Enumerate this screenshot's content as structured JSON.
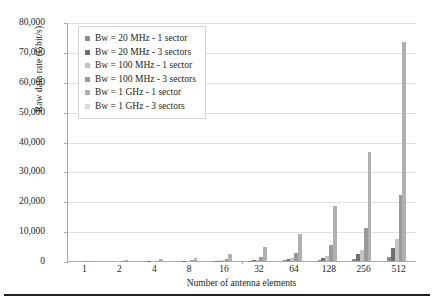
{
  "chart_data": {
    "type": "bar",
    "title": "",
    "xlabel": "Number of antenna elements",
    "ylabel": "Raw data rate (Gbit/s)",
    "categories": [
      "1",
      "2",
      "4",
      "8",
      "16",
      "32",
      "64",
      "128",
      "256",
      "512"
    ],
    "ylim": [
      0,
      80000
    ],
    "yticks": [
      0,
      10000,
      20000,
      30000,
      40000,
      50000,
      60000,
      70000,
      80000
    ],
    "ytick_labels": [
      "0",
      "10,000",
      "20,000",
      "30,000",
      "40,000",
      "50,000",
      "60,000",
      "70,000",
      "80,000"
    ],
    "grid": "horizontal",
    "legend_position": "upper-left-inside",
    "series": [
      {
        "name": "Bw = 20 MHz - 1 sector",
        "color": "#8c8c8c",
        "values": [
          2.8,
          5.7,
          11.4,
          22.9,
          45.8,
          91.5,
          183,
          366,
          732,
          1464
        ]
      },
      {
        "name": "Bw = 20 MHz - 3 sectors",
        "color": "#6e6e6e",
        "values": [
          8.6,
          17.2,
          34.3,
          68.6,
          137,
          275,
          549,
          1098,
          2196,
          4392
        ]
      },
      {
        "name": "Bw = 100 MHz - 1 sector",
        "color": "#c4c4c4",
        "values": [
          14.3,
          28.6,
          57.2,
          114,
          229,
          458,
          915,
          1830,
          3660,
          7320
        ]
      },
      {
        "name": "Bw = 100 MHz - 3 sectors",
        "color": "#9a9a9a",
        "values": [
          42.9,
          85.8,
          172,
          343,
          686,
          1373,
          2745,
          5490,
          10980,
          21960
        ]
      },
      {
        "name": "Bw = 1 GHz - 1 sector",
        "color": "#b0b0b0",
        "values": [
          143,
          286,
          572,
          1144,
          2288,
          4576,
          9152,
          18304,
          36608,
          73216
        ]
      },
      {
        "name": "Bw = 1 GHz - 3 sectors",
        "color": "#d9d9d9",
        "values": [
          0,
          0,
          0,
          0,
          0,
          0,
          0,
          0,
          0,
          0
        ]
      }
    ]
  }
}
